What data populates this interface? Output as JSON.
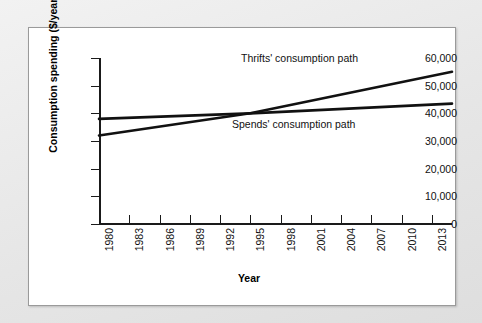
{
  "figure": {
    "background_color": "#e9e9e9",
    "panel_color": "#ffffff",
    "line_color": "#111111"
  },
  "chart_data": {
    "type": "line",
    "title": "",
    "xlabel": "Year",
    "ylabel": "Consumption spending ($/year)",
    "xlim": [
      1980,
      2015
    ],
    "ylim": [
      0,
      60000
    ],
    "grid": false,
    "legend": "inline-annotations",
    "x_tick_labels": [
      "1980",
      "1983",
      "1986",
      "1989",
      "1992",
      "1995",
      "1998",
      "2001",
      "2004",
      "2007",
      "2010",
      "2013"
    ],
    "x_tick_values": [
      1980,
      1983,
      1986,
      1989,
      1992,
      1995,
      1998,
      2001,
      2004,
      2007,
      2010,
      2013
    ],
    "y_tick_labels": [
      "0",
      "10,000",
      "20,000",
      "30,000",
      "40,000",
      "50,000",
      "60,000"
    ],
    "y_tick_values": [
      0,
      10000,
      20000,
      30000,
      40000,
      50000,
      60000
    ],
    "annotations": [
      {
        "text": "Thrifts' consumption path",
        "series": "Thrifts"
      },
      {
        "text": "Spends' consumption path",
        "series": "Spends"
      }
    ],
    "series": [
      {
        "name": "Thrifts",
        "label": "Thrifts' consumption path",
        "color": "#111111",
        "x": [
          1980,
          1995,
          2015
        ],
        "values": [
          32000,
          40000,
          55000
        ]
      },
      {
        "name": "Spends",
        "label": "Spends' consumption path",
        "color": "#111111",
        "x": [
          1980,
          1995,
          2015
        ],
        "values": [
          38000,
          40000,
          43500
        ]
      }
    ],
    "crossover": {
      "year": 1995,
      "value": 40000
    }
  }
}
